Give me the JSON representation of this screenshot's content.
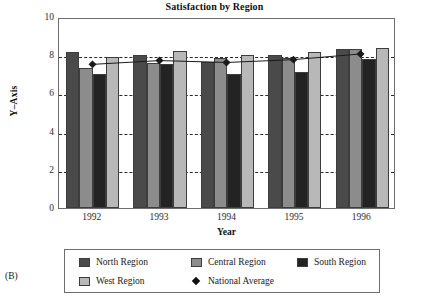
{
  "panel_label": "(B)",
  "chart_data": {
    "type": "bar",
    "title": "Satisfaction by Region",
    "xlabel": "Year",
    "ylabel": "Y–Axis",
    "categories": [
      "1992",
      "1993",
      "1994",
      "1995",
      "1996"
    ],
    "ylim": [
      0,
      10
    ],
    "yticks": [
      0,
      2,
      4,
      6,
      8,
      10
    ],
    "ytick_labels": [
      "0",
      "2",
      "4",
      "6",
      "8",
      "10"
    ],
    "grid": true,
    "grid_style": "dashed-horizontal",
    "legend_position": "bottom",
    "series": [
      {
        "name": "North Region",
        "kind": "bar",
        "color": "#4a4a4a",
        "values": [
          8.15,
          8.0,
          7.65,
          8.0,
          8.3
        ]
      },
      {
        "name": "Central Region",
        "kind": "bar",
        "color": "#8c8c8c",
        "values": [
          7.35,
          7.6,
          7.85,
          7.85,
          8.3
        ]
      },
      {
        "name": "South Region",
        "kind": "bar",
        "color": "#232323",
        "values": [
          7.0,
          7.55,
          7.0,
          7.1,
          7.8
        ]
      },
      {
        "name": "West Region",
        "kind": "bar",
        "color": "#b8b8b8",
        "values": [
          7.9,
          8.2,
          8.0,
          8.15,
          8.4
        ]
      },
      {
        "name": "National Average",
        "kind": "line",
        "marker": "diamond",
        "color": "#1a1a1a",
        "values": [
          7.6,
          7.8,
          7.7,
          7.85,
          8.15
        ]
      }
    ]
  }
}
